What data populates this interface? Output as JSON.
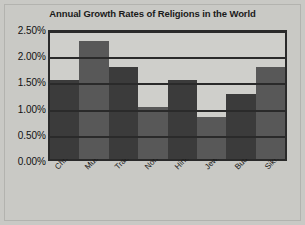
{
  "chart_data": {
    "type": "bar",
    "title": "Annual Growth Rates of Religions in the World",
    "xlabel": "",
    "ylabel": "",
    "categories": [
      "Christian",
      "Muslim",
      "Traditional",
      "Non-Religious",
      "Hindu",
      "Jewish",
      "Buddhist",
      "Sikh"
    ],
    "values": [
      1.5,
      2.25,
      1.75,
      1.0,
      1.5,
      0.8,
      1.25,
      1.75
    ],
    "value_unit": "%",
    "ylim": [
      0,
      2.5
    ],
    "yticks": [
      0.0,
      0.5,
      1.0,
      1.5,
      2.0,
      2.5
    ],
    "ytick_labels": [
      "0.00%",
      "0.50%",
      "1.00%",
      "1.50%",
      "2.00%",
      "2.50%"
    ],
    "grid": true,
    "legend": false,
    "bar_colors": [
      "#3b3b3b",
      "#585858",
      "#3b3b3b",
      "#585858",
      "#3b3b3b",
      "#585858",
      "#3b3b3b",
      "#585858"
    ],
    "axis_color": "#2a2a2a",
    "plot_background": "#cfcfcb",
    "figure_background": "#c9c9c5"
  }
}
